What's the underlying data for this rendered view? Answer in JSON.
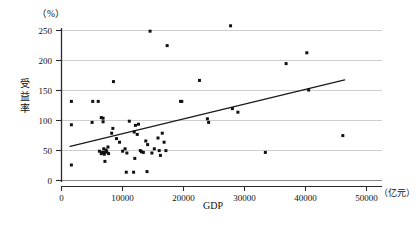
{
  "chart_data": {
    "type": "scatter",
    "title": "",
    "subtitle": "",
    "xlabel": "GDP",
    "ylabel": "受益率",
    "x_unit": "（亿元）",
    "y_unit": "（%）",
    "xlim": [
      0,
      50000
    ],
    "ylim": [
      0,
      265
    ],
    "x_ticks": [
      0,
      10000,
      20000,
      30000,
      40000,
      50000
    ],
    "x_tick_labels": [
      "0",
      "10000",
      "20000",
      "30000",
      "40000",
      "50000"
    ],
    "y_ticks": [
      0,
      50,
      100,
      150,
      200,
      250
    ],
    "y_tick_labels": [
      "0",
      "50",
      "100",
      "150",
      "200",
      "250"
    ],
    "grid": {
      "horizontal": true,
      "vertical": false
    },
    "legend": {
      "show": false,
      "position": "none"
    },
    "marker": {
      "shape": "square",
      "size": 3,
      "color": "#111111"
    },
    "series": [
      {
        "name": "省市受益率",
        "points": [
          [
            1700,
            131
          ],
          [
            1700,
            92
          ],
          [
            1700,
            25
          ],
          [
            5200,
            131
          ],
          [
            6100,
            131
          ],
          [
            5100,
            96
          ],
          [
            6600,
            104
          ],
          [
            6900,
            103
          ],
          [
            6900,
            97
          ],
          [
            6300,
            48
          ],
          [
            6600,
            44
          ],
          [
            6800,
            46
          ],
          [
            7000,
            52
          ],
          [
            7100,
            43
          ],
          [
            7200,
            46
          ],
          [
            7400,
            50
          ],
          [
            7500,
            47
          ],
          [
            7700,
            55
          ],
          [
            7800,
            44
          ],
          [
            7200,
            31
          ],
          [
            8600,
            164
          ],
          [
            8500,
            86
          ],
          [
            8300,
            78
          ],
          [
            9100,
            69
          ],
          [
            9600,
            63
          ],
          [
            10100,
            48
          ],
          [
            10500,
            52
          ],
          [
            10800,
            45
          ],
          [
            10700,
            13
          ],
          [
            11900,
            13
          ],
          [
            11200,
            98
          ],
          [
            12200,
            91
          ],
          [
            12700,
            93
          ],
          [
            12000,
            80
          ],
          [
            12500,
            76
          ],
          [
            12100,
            36
          ],
          [
            13000,
            49
          ],
          [
            13200,
            47
          ],
          [
            13500,
            46
          ],
          [
            13900,
            65
          ],
          [
            14200,
            59
          ],
          [
            14100,
            14
          ],
          [
            14600,
            248
          ],
          [
            14900,
            45
          ],
          [
            15300,
            52
          ],
          [
            15900,
            70
          ],
          [
            16100,
            49
          ],
          [
            16600,
            78
          ],
          [
            16900,
            63
          ],
          [
            16300,
            41
          ],
          [
            17200,
            49
          ],
          [
            17400,
            224
          ],
          [
            19800,
            131
          ],
          [
            19600,
            131
          ],
          [
            22700,
            166
          ],
          [
            24000,
            102
          ],
          [
            24200,
            96
          ],
          [
            27800,
            257
          ],
          [
            28100,
            119
          ],
          [
            29000,
            113
          ],
          [
            33500,
            46
          ],
          [
            36900,
            194
          ],
          [
            40300,
            212
          ],
          [
            40600,
            150
          ],
          [
            46200,
            74
          ]
        ]
      }
    ],
    "trendline": {
      "show": true,
      "x_start": 1500,
      "y_start": 56,
      "x_end": 46500,
      "y_end": 167,
      "color": "#1a1a1a"
    }
  },
  "axes": {
    "x_unit_text": "（亿元）",
    "y_unit_text": "（%）",
    "x_title": "GDP",
    "y_title_chars": [
      "受",
      "益",
      "率"
    ]
  }
}
